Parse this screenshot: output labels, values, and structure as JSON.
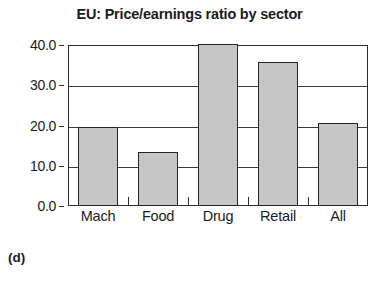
{
  "chart_data": {
    "type": "bar",
    "title": "EU: Price/earnings ratio by sector",
    "xlabel": "",
    "ylabel": "",
    "categories": [
      "Mach",
      "Food",
      "Drug",
      "Retail",
      "All"
    ],
    "values": [
      19.6,
      13.4,
      40.2,
      35.7,
      20.6
    ],
    "ylim": [
      0.0,
      40.0
    ],
    "yticks": [
      0.0,
      10.0,
      20.0,
      30.0,
      40.0
    ],
    "ytick_labels": [
      "0.0",
      "10.0",
      "20.0",
      "30.0",
      "40.0"
    ],
    "grid": true,
    "legend": false,
    "bar_fill_color": "#c6c6c6",
    "bar_edge_color": "#252525",
    "axis_color": "#2b2b2b",
    "background_color": "#ffffff"
  },
  "caption": "(d)"
}
